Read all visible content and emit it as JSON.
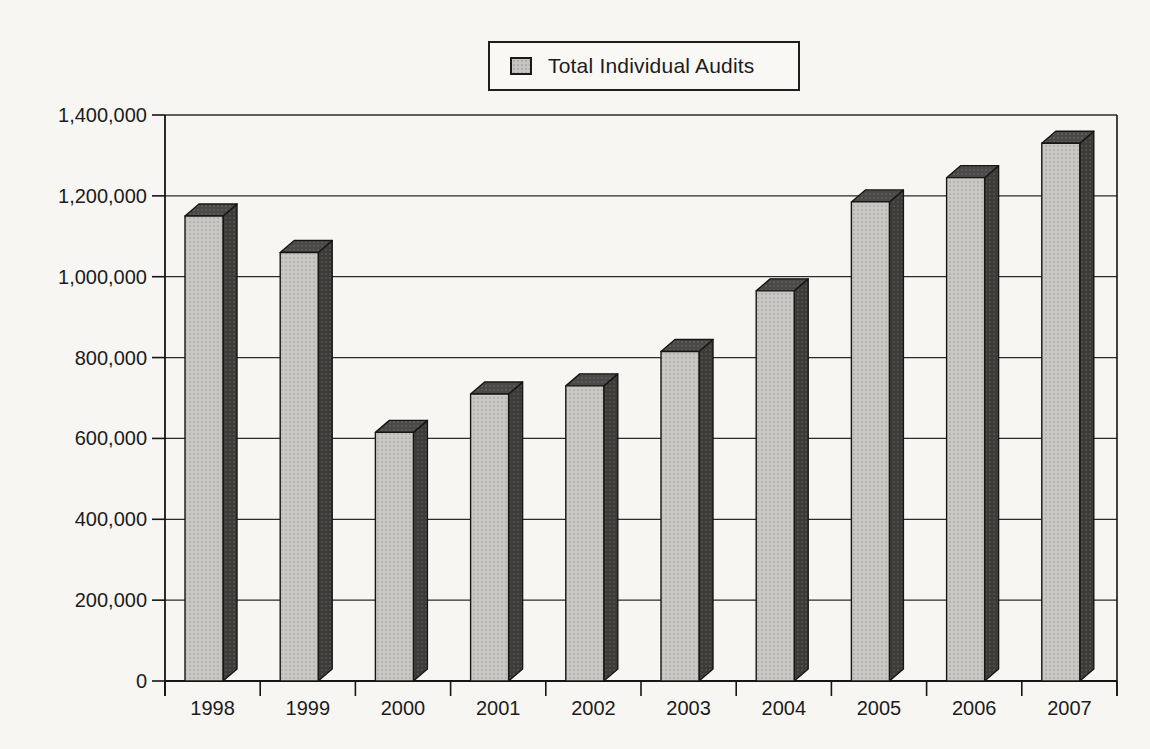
{
  "page": {
    "background_color": "#f7f6f3"
  },
  "legend": {
    "label": "Total Individual Audits",
    "swatch_color": "#c6c5c2"
  },
  "chart_data": {
    "type": "bar",
    "style": "3d-column",
    "title": "",
    "xlabel": "",
    "ylabel": "",
    "categories": [
      "1998",
      "1999",
      "2000",
      "2001",
      "2002",
      "2003",
      "2004",
      "2005",
      "2006",
      "2007"
    ],
    "series": [
      {
        "name": "Total Individual Audits",
        "values": [
          1150000,
          1060000,
          615000,
          710000,
          730000,
          815000,
          965000,
          1185000,
          1245000,
          1330000
        ]
      }
    ],
    "ylim": [
      0,
      1400000
    ],
    "ytick_step": 200000,
    "ytick_labels": [
      "0",
      "200,000",
      "400,000",
      "600,000",
      "800,000",
      "1,000,000",
      "1,200,000",
      "1,400,000"
    ],
    "grid": true,
    "legend_position": "top-center",
    "colors": {
      "bar_front": "#c9c8c5",
      "bar_front_dot": "#aeadaa",
      "bar_top": "#4a4947",
      "bar_top_dot": "#61605d",
      "bar_side": "#3c3b39",
      "bar_side_dot": "#555451",
      "outline": "#161616",
      "gridline": "#2b2b2b",
      "axis": "#161616",
      "text": "#1c1c1c"
    }
  }
}
